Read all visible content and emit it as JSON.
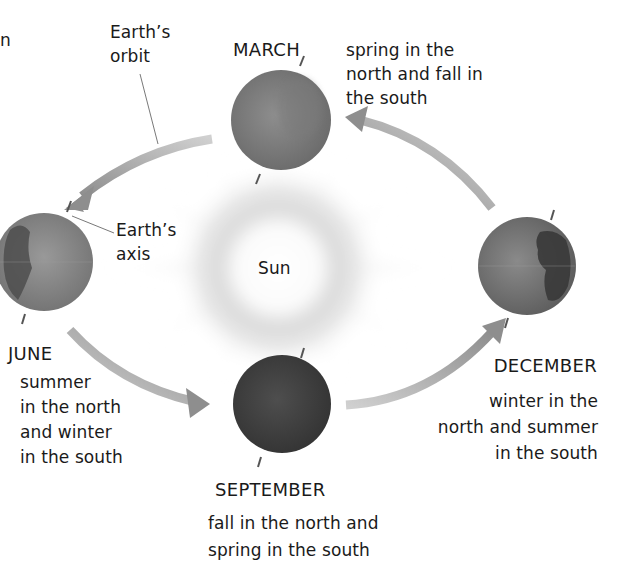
{
  "diagram": {
    "title_fragment": "n",
    "sun": {
      "label": "Sun"
    },
    "labels": {
      "orbit_line1": "Earth’s",
      "orbit_line2": "orbit",
      "axis_line1": "Earth’s",
      "axis_line2": "axis"
    },
    "seasons": [
      {
        "month": "MARCH",
        "description": [
          "spring in the",
          "north and fall in",
          "the south"
        ]
      },
      {
        "month": "JUNE",
        "description": [
          "summer",
          "in the north",
          "and winter",
          "in the south"
        ]
      },
      {
        "month": "SEPTEMBER",
        "description": [
          "fall in the north and",
          "spring in the south"
        ]
      },
      {
        "month": "DECEMBER",
        "description": [
          "winter in the",
          "north and summer",
          "in the south"
        ]
      }
    ],
    "colors": {
      "background": "#ffffff",
      "text": "#1a1a1a",
      "arrow": "#9a9a9a",
      "earth_march": "#7d7d7d",
      "earth_june": "#858585",
      "earth_september": "#444444",
      "earth_december": "#6e6e6e",
      "sun_glow": "#d6d6d6"
    }
  }
}
